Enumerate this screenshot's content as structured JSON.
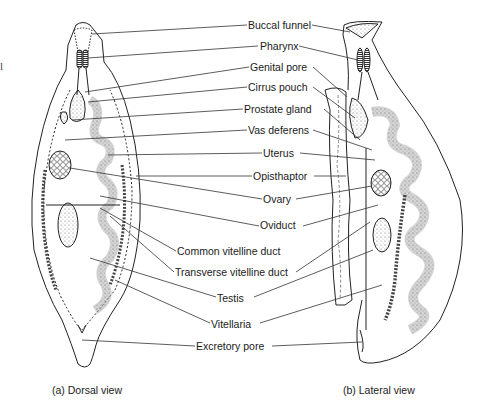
{
  "figure": {
    "stray_mark": "l",
    "labels": [
      {
        "id": "buccal-funnel",
        "text": "Buccal funnel",
        "x": 248,
        "y": 19
      },
      {
        "id": "pharynx",
        "text": "Pharynx",
        "x": 260,
        "y": 40
      },
      {
        "id": "genital-pore",
        "text": "Genital pore",
        "x": 250,
        "y": 61
      },
      {
        "id": "cirrus-pouch",
        "text": "Cirrus pouch",
        "x": 248,
        "y": 81
      },
      {
        "id": "prostate-gland",
        "text": "Prostate gland",
        "x": 244,
        "y": 103
      },
      {
        "id": "vas-deferens",
        "text": "Vas deferens",
        "x": 248,
        "y": 124
      },
      {
        "id": "uterus",
        "text": "Uterus",
        "x": 263,
        "y": 147
      },
      {
        "id": "opisthaptor",
        "text": "Opisthaptor",
        "x": 253,
        "y": 170
      },
      {
        "id": "ovary",
        "text": "Ovary",
        "x": 263,
        "y": 193
      },
      {
        "id": "oviduct",
        "text": "Oviduct",
        "x": 260,
        "y": 219
      },
      {
        "id": "common-vitelline-duct",
        "text": "Common vitelline duct",
        "x": 177,
        "y": 245
      },
      {
        "id": "transverse-vitelline-duct",
        "text": "Transverse vitelline duct",
        "x": 175,
        "y": 266
      },
      {
        "id": "testis",
        "text": "Testis",
        "x": 217,
        "y": 292
      },
      {
        "id": "vitellaria",
        "text": "Vitellaria",
        "x": 211,
        "y": 318
      },
      {
        "id": "excretory-pore",
        "text": "Excretory pore",
        "x": 196,
        "y": 340
      }
    ],
    "captions": [
      {
        "id": "dorsal",
        "text": "(a)  Dorsal view",
        "x": 52,
        "y": 384
      },
      {
        "id": "lateral",
        "text": "(b)  Lateral view",
        "x": 343,
        "y": 384
      }
    ]
  }
}
